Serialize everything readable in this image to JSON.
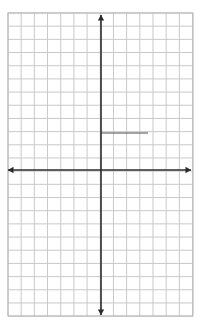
{
  "figure": {
    "kind": "cartesian-coordinate-grid",
    "title": "",
    "background_color": "#ffffff",
    "width": 201,
    "height": 332
  },
  "grid": {
    "line_color": "#c9c9c9",
    "line_width": 1,
    "border_color": "#b4b4b4",
    "cell_size": 13.18,
    "left": 8,
    "top": 13,
    "right": 193,
    "bottom": 316,
    "columns": 14,
    "rows": 23,
    "visible": true
  },
  "axes": {
    "color": "#2b2b2b",
    "line_width": 1.6,
    "arrowheads": true,
    "origin": {
      "x": 101,
      "y": 170
    },
    "x_axis": {
      "label": "",
      "start_x": 8,
      "end_x": 191,
      "y": 170,
      "tick_labels": [],
      "arrow_left": true,
      "arrow_right": true
    },
    "y_axis": {
      "label": "",
      "x": 101,
      "start_y": 15,
      "end_y": 315,
      "tick_labels": [],
      "arrow_up": true,
      "arrow_down": true
    }
  },
  "chart_data": {
    "type": "line",
    "title": "",
    "xlabel": "",
    "ylabel": "",
    "xlim": [
      -7,
      7
    ],
    "ylim": [
      -11,
      12
    ],
    "grid": true,
    "legend": false,
    "legend_position": "none",
    "categories": [],
    "values": [],
    "series": [
      {
        "name": "segment",
        "color": "#4a4a4a",
        "line_width": 1,
        "points": [
          {
            "x": 0,
            "y": 2.8
          },
          {
            "x": 3.6,
            "y": 2.8
          }
        ],
        "pixel_points": [
          {
            "x": 101,
            "y": 133
          },
          {
            "x": 148,
            "y": 133
          }
        ]
      }
    ],
    "annotations": []
  }
}
